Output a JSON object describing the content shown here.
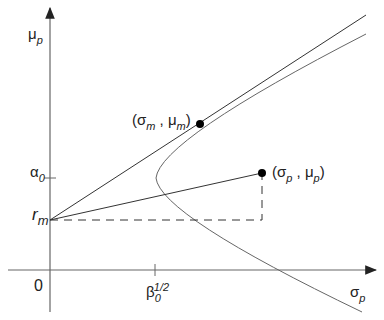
{
  "diagram": {
    "y_axis": {
      "symbol": "μ",
      "subscript": "p"
    },
    "x_axis": {
      "symbol": "σ",
      "subscript": "p"
    },
    "origin": "0",
    "y_ticks": [
      {
        "symbol": "α",
        "subscript": "0"
      },
      {
        "symbol": "r",
        "subscript": "m"
      }
    ],
    "x_ticks": [
      {
        "symbol": "β",
        "subscript": "0",
        "superscript": "1/2"
      }
    ],
    "points": [
      {
        "name": "tangency",
        "open": "(σ",
        "sub1": "m",
        "mid": " , μ",
        "sub2": "m",
        "close": ")"
      },
      {
        "name": "portfolio",
        "open": "(σ",
        "sub1": "p",
        "mid": " , μ",
        "sub2": "p",
        "close": ")"
      }
    ],
    "colors": {
      "line": "#333333",
      "curve": "#666666",
      "axis": "#555555"
    }
  }
}
